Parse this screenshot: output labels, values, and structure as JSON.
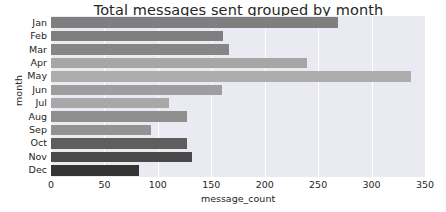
{
  "chart_data": {
    "type": "bar",
    "orientation": "horizontal",
    "title": "Total messages sent grouped by month",
    "xlabel": "message_count",
    "ylabel": "month",
    "categories": [
      "Jan",
      "Feb",
      "Mar",
      "Apr",
      "May",
      "Jun",
      "Jul",
      "Aug",
      "Sep",
      "Oct",
      "Nov",
      "Dec"
    ],
    "values": [
      269,
      161,
      167,
      240,
      337,
      160,
      110,
      127,
      94,
      127,
      132,
      82
    ],
    "bar_colors": [
      "#7f7f7f",
      "#7f7f7f",
      "#868686",
      "#a6a6a6",
      "#adadad",
      "#9e9e9e",
      "#a8a8a8",
      "#8f8f8f",
      "#939393",
      "#5e5e5e",
      "#4a4a4a",
      "#343434"
    ],
    "xlim": [
      0,
      350
    ],
    "xticks": [
      0,
      50,
      100,
      150,
      200,
      250,
      300,
      350
    ],
    "xtick_labels": [
      "0",
      "50",
      "100",
      "150",
      "200",
      "250",
      "300",
      "350"
    ],
    "ytick_labels": [
      "Jan",
      "Feb",
      "Mar",
      "Apr",
      "May",
      "Jun",
      "Jul",
      "Aug",
      "Sep",
      "Oct",
      "Nov",
      "Dec"
    ],
    "grid": true,
    "grid_axis": "x",
    "grid_color": "#ffffff",
    "plot_background": "#eaeaf2",
    "figure_background": "#ffffff",
    "legend": null,
    "legend_position": "none"
  }
}
